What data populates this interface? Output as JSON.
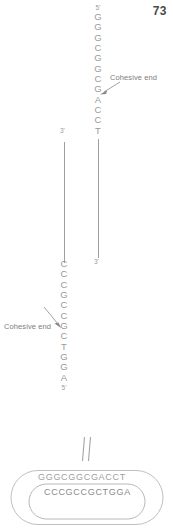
{
  "page": {
    "number": "73"
  },
  "figure": {
    "top_strand": {
      "five_prime_label": "5'",
      "bases": [
        "G",
        "G",
        "G",
        "C",
        "G",
        "G",
        "C",
        "G",
        "A",
        "C",
        "C",
        "T"
      ],
      "three_prime_label": "3'"
    },
    "bottom_strand": {
      "bases": [
        "C",
        "C",
        "C",
        "G",
        "C",
        "C",
        "G",
        "C",
        "T",
        "G",
        "G",
        "A"
      ],
      "five_prime_label": "5'",
      "three_prime_label": "3'"
    },
    "callouts": {
      "top": "Cohesive end",
      "bottom": "Cohesive end"
    },
    "connector": {
      "name": "double-line-arrow"
    },
    "plasmid": {
      "outer_sequence": "GGGCGGCGACCT",
      "inner_sequence": "CCCGCCGCTGGA"
    },
    "colors": {
      "text": "#9a9a9a",
      "line": "#9f9f9f",
      "page_number": "#4a4a4a"
    }
  }
}
